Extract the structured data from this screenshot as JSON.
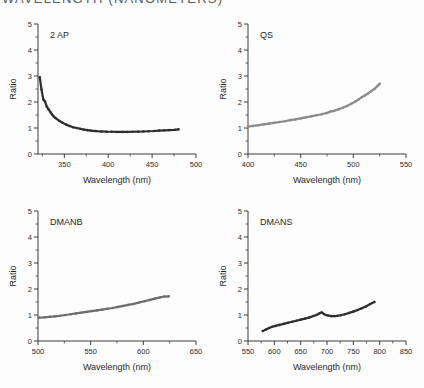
{
  "page": {
    "cut_off_header_text": "WAVELENGTH (NANOMETERS)",
    "background_color": "#ffffff"
  },
  "common": {
    "xlabel": "Wavelength (nm)",
    "ylabel": "Ratio",
    "ylim": [
      0,
      5
    ],
    "yticks": [
      0,
      1,
      2,
      3,
      4,
      5
    ],
    "grid": false,
    "legend": "none"
  },
  "chart_data": [
    {
      "type": "scatter",
      "title": "2 AP",
      "xlabel": "Wavelength (nm)",
      "ylabel": "Ratio",
      "xlim": [
        320,
        500
      ],
      "ylim": [
        0,
        5
      ],
      "xticks": [
        350,
        400,
        450,
        500
      ],
      "yticks": [
        0,
        1,
        2,
        3,
        4,
        5
      ],
      "marker_color": "#2e2e2e",
      "x": [
        322,
        324,
        326,
        328,
        330,
        332,
        334,
        336,
        338,
        340,
        344,
        348,
        352,
        356,
        360,
        364,
        368,
        372,
        376,
        380,
        386,
        392,
        398,
        404,
        410,
        416,
        422,
        428,
        434,
        440,
        446,
        452,
        458,
        464,
        470,
        476,
        480
      ],
      "y": [
        2.95,
        2.48,
        2.1,
        2.02,
        1.82,
        1.72,
        1.62,
        1.52,
        1.44,
        1.38,
        1.28,
        1.2,
        1.13,
        1.08,
        1.03,
        1.0,
        0.97,
        0.94,
        0.92,
        0.9,
        0.88,
        0.87,
        0.86,
        0.855,
        0.85,
        0.85,
        0.85,
        0.855,
        0.86,
        0.865,
        0.875,
        0.885,
        0.9,
        0.91,
        0.92,
        0.93,
        0.95
      ]
    },
    {
      "type": "scatter",
      "title": "QS",
      "xlabel": "Wavelength (nm)",
      "ylabel": "Ratio",
      "xlim": [
        400,
        550
      ],
      "ylim": [
        0,
        5
      ],
      "xticks": [
        400,
        450,
        500,
        550
      ],
      "yticks": [
        0,
        1,
        2,
        3,
        4,
        5
      ],
      "marker_color": "#8a8a8a",
      "x": [
        400,
        405,
        410,
        415,
        420,
        425,
        430,
        435,
        440,
        445,
        450,
        455,
        460,
        465,
        470,
        475,
        478,
        482,
        486,
        490,
        494,
        498,
        502,
        505,
        508,
        511,
        514,
        517,
        520,
        523,
        525
      ],
      "y": [
        1.05,
        1.08,
        1.11,
        1.14,
        1.17,
        1.2,
        1.23,
        1.26,
        1.3,
        1.33,
        1.37,
        1.41,
        1.45,
        1.49,
        1.53,
        1.58,
        1.63,
        1.66,
        1.72,
        1.78,
        1.85,
        1.93,
        2.02,
        2.1,
        2.18,
        2.25,
        2.33,
        2.42,
        2.5,
        2.62,
        2.7
      ]
    },
    {
      "type": "scatter",
      "title": "DMANB",
      "xlabel": "Wavelength (nm)",
      "ylabel": "Ratio",
      "xlim": [
        500,
        650
      ],
      "ylim": [
        0,
        5
      ],
      "xticks": [
        500,
        550,
        600,
        650
      ],
      "yticks": [
        0,
        1,
        2,
        3,
        4,
        5
      ],
      "marker_color": "#6e6e6e",
      "x": [
        501,
        506,
        511,
        516,
        521,
        526,
        531,
        536,
        541,
        546,
        551,
        556,
        561,
        566,
        571,
        576,
        581,
        586,
        591,
        596,
        601,
        606,
        611,
        616,
        620,
        624
      ],
      "y": [
        0.9,
        0.91,
        0.93,
        0.95,
        0.97,
        1.0,
        1.03,
        1.06,
        1.09,
        1.12,
        1.15,
        1.18,
        1.21,
        1.24,
        1.27,
        1.31,
        1.35,
        1.39,
        1.43,
        1.48,
        1.53,
        1.58,
        1.63,
        1.68,
        1.71,
        1.72
      ]
    },
    {
      "type": "scatter",
      "title": "DMANS",
      "xlabel": "Wavelength (nm)",
      "ylabel": "Ratio",
      "xlim": [
        550,
        850
      ],
      "ylim": [
        0,
        5
      ],
      "xticks": [
        550,
        600,
        650,
        700,
        750,
        800,
        850
      ],
      "yticks": [
        0,
        1,
        2,
        3,
        4,
        5
      ],
      "marker_color": "#2e2e2e",
      "x": [
        578,
        584,
        590,
        596,
        602,
        610,
        618,
        626,
        634,
        642,
        650,
        658,
        666,
        674,
        680,
        686,
        690,
        694,
        698,
        702,
        708,
        714,
        720,
        726,
        734,
        742,
        750,
        758,
        766,
        774,
        782,
        790
      ],
      "y": [
        0.38,
        0.44,
        0.5,
        0.55,
        0.58,
        0.62,
        0.66,
        0.7,
        0.74,
        0.78,
        0.82,
        0.86,
        0.9,
        0.96,
        1.0,
        1.07,
        1.1,
        1.04,
        1.0,
        0.98,
        0.96,
        0.96,
        0.97,
        0.99,
        1.03,
        1.08,
        1.13,
        1.19,
        1.26,
        1.33,
        1.42,
        1.5
      ]
    }
  ]
}
